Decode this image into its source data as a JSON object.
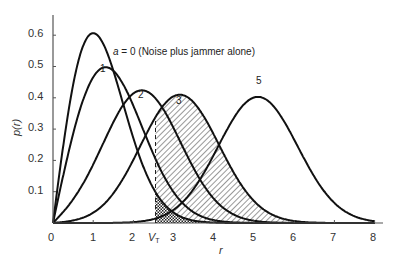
{
  "chart_data": {
    "type": "line",
    "title": "",
    "annotation": "a = 0  (Noise plus jammer alone)",
    "xlabel": "r",
    "ylabel": "p(r)",
    "xlim": [
      0,
      8
    ],
    "ylim": [
      0,
      0.65
    ],
    "x_ticks": [
      "0",
      "1",
      "2",
      "V_T",
      "3",
      "4",
      "5",
      "6",
      "7",
      "8"
    ],
    "y_ticks": [
      "0.1",
      "0.2",
      "0.3",
      "0.4",
      "0.5",
      "0.6"
    ],
    "threshold": {
      "label": "V_T",
      "x": 2.55
    },
    "grid": false,
    "x": [
      0,
      0.5,
      1,
      1.5,
      2,
      2.5,
      3,
      3.5,
      4,
      4.5,
      5,
      5.5,
      6,
      6.5,
      7,
      7.5,
      8
    ],
    "series": [
      {
        "name": "a = 0",
        "label_text": "",
        "values": [
          0,
          0.441,
          0.607,
          0.487,
          0.271,
          0.11,
          0.033,
          0.008,
          0.001,
          0,
          0,
          0,
          0,
          0,
          0,
          0,
          0
        ],
        "fill": "crosshatch right of V_T"
      },
      {
        "name": "1",
        "label_text": "1",
        "values": [
          0,
          0.29,
          0.466,
          0.48,
          0.374,
          0.225,
          0.107,
          0.04,
          0.012,
          0.003,
          0.001,
          0,
          0,
          0,
          0,
          0,
          0
        ]
      },
      {
        "name": "2",
        "label_text": "2",
        "values": [
          0,
          0.072,
          0.195,
          0.333,
          0.416,
          0.405,
          0.313,
          0.191,
          0.093,
          0.035,
          0.011,
          0.003,
          0.001,
          0,
          0,
          0,
          0
        ]
      },
      {
        "name": "3",
        "label_text": "3",
        "values": [
          0,
          0.006,
          0.033,
          0.099,
          0.209,
          0.333,
          0.405,
          0.388,
          0.291,
          0.17,
          0.078,
          0.028,
          0.008,
          0.002,
          0,
          0,
          0
        ],
        "fill": "diagonal hatch right of V_T"
      },
      {
        "name": "5",
        "label_text": "5",
        "values": [
          0,
          0,
          0,
          0,
          0.002,
          0.013,
          0.049,
          0.134,
          0.255,
          0.36,
          0.399,
          0.355,
          0.254,
          0.146,
          0.066,
          0.024,
          0.007
        ]
      }
    ],
    "rician_params": [
      0,
      1,
      2,
      3,
      5
    ]
  },
  "labels": {
    "a_prefix": "a",
    "a_rest": " = 0  (Noise plus jammer alone)",
    "c1": "1",
    "c2": "2",
    "c3": "3",
    "c5": "5",
    "xlabel": "r",
    "ylabel": "p(r)",
    "vt_main": "V",
    "vt_sub": "T",
    "x0": "0",
    "x1": "1",
    "x2": "2",
    "x3": "3",
    "x4": "4",
    "x5": "5",
    "x6": "6",
    "x7": "7",
    "x8": "8",
    "y1": "0.1",
    "y2": "0.2",
    "y3": "0.3",
    "y4": "0.4",
    "y5": "0.5",
    "y6": "0.6"
  }
}
